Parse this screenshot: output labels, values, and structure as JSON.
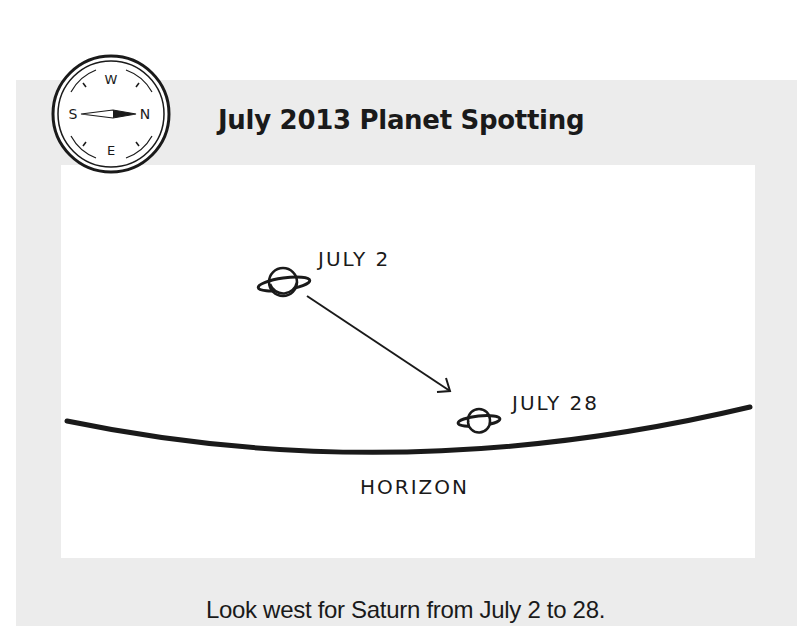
{
  "diagram": {
    "title": "July 2013 Planet Spotting",
    "caption": "Look west for Saturn from July 2 to 28.",
    "compass": {
      "icon": "compass-icon",
      "labels": {
        "north": "N",
        "south": "S",
        "east": "E",
        "west": "W"
      }
    },
    "planets": [
      {
        "label": "JULY 2",
        "icon": "saturn-icon"
      },
      {
        "label": "JULY 28",
        "icon": "saturn-icon"
      }
    ],
    "horizon_label": "HORIZON",
    "colors": {
      "panel": "#ececec",
      "inner": "#ffffff",
      "ink": "#1a1a1a"
    }
  }
}
